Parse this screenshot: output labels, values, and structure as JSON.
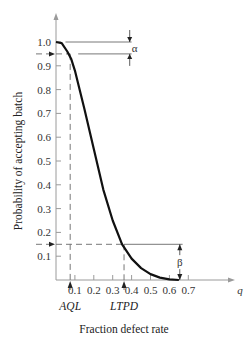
{
  "chart_data": {
    "type": "line",
    "title": "",
    "xlabel": "Fraction defect rate",
    "ylabel": "Probability of accepting batch",
    "x_axis_symbol": "q",
    "xlim": [
      0,
      0.75
    ],
    "ylim": [
      0,
      1.05
    ],
    "x_ticks": [
      "0.1",
      "0.2",
      "0.3",
      "0.4",
      "0.5",
      "0.6",
      "0.7"
    ],
    "y_ticks": [
      "0.1",
      "0.2",
      "0.3",
      "0.4",
      "0.5",
      "0.6",
      "0.7",
      "0.8",
      "0.9",
      "1.0"
    ],
    "grid": false,
    "series": [
      {
        "name": "OC curve",
        "x": [
          0.0,
          0.03,
          0.06,
          0.08,
          0.1,
          0.15,
          0.2,
          0.25,
          0.3,
          0.35,
          0.4,
          0.45,
          0.5,
          0.55,
          0.6,
          0.65
        ],
        "y": [
          1.0,
          0.995,
          0.96,
          0.93,
          0.88,
          0.72,
          0.55,
          0.38,
          0.25,
          0.15,
          0.09,
          0.05,
          0.025,
          0.01,
          0.003,
          0.0
        ]
      }
    ],
    "annotations": [
      {
        "label": "AQL",
        "x": 0.075,
        "y": 0.95
      },
      {
        "label": "LTPD",
        "x": 0.36,
        "y": 0.15
      },
      {
        "label": "α",
        "description": "producer's risk, gap between 1.0 and 0.95"
      },
      {
        "label": "β",
        "description": "consumer's risk, 0.15 at LTPD"
      }
    ],
    "legend": "none"
  }
}
